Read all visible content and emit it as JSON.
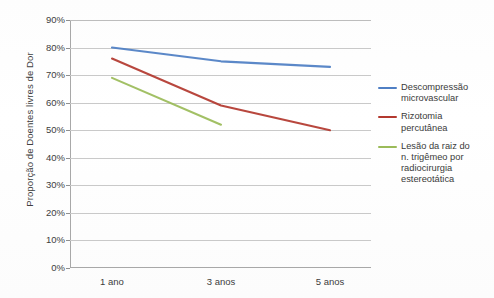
{
  "chart_data": {
    "type": "line",
    "title": "",
    "xlabel": "",
    "ylabel": "Proporção de Doentes livres de Dor",
    "categories": [
      "1 ano",
      "3 anos",
      "5 anos"
    ],
    "ytick_labels": [
      "90%",
      "80%",
      "70%",
      "60%",
      "50%",
      "40%",
      "30%",
      "20%",
      "10%",
      "0%"
    ],
    "ytick_values": [
      90,
      80,
      70,
      60,
      50,
      40,
      30,
      20,
      10,
      0
    ],
    "ylim": [
      0,
      90
    ],
    "grid": "horizontal",
    "legend_position": "right",
    "series": [
      {
        "name": "Descompressão microvascular",
        "color": "#4f7fc4",
        "x": [
          "1 ano",
          "3 anos",
          "5 anos"
        ],
        "values": [
          80,
          75,
          73
        ]
      },
      {
        "name": "Rizotomia percutânea",
        "color": "#b3392f",
        "x": [
          "1 ano",
          "3 anos",
          "5 anos"
        ],
        "values": [
          76,
          59,
          50
        ]
      },
      {
        "name": "Lesão da raiz do n. trigêmeo por radiocirurgia estereotática",
        "color": "#9bbb59",
        "x": [
          "1 ano",
          "3 anos"
        ],
        "values": [
          69,
          52
        ]
      }
    ]
  },
  "legend": {
    "entries": [
      {
        "label": "Descompressão\nmicrovascular",
        "color": "#4f7fc4"
      },
      {
        "label": "Rizotomia\npercutânea",
        "color": "#b3392f"
      },
      {
        "label": "Lesão da raiz do\nn. trigêmeo por\nradiocirurgia\nestereotática",
        "color": "#9bbb59"
      }
    ]
  },
  "axes": {
    "y_title": "Proporção de Doentes livres de Dor",
    "y_ticks": [
      "90%",
      "80%",
      "70%",
      "60%",
      "50%",
      "40%",
      "30%",
      "20%",
      "10%",
      "0%"
    ],
    "x_ticks": [
      "1 ano",
      "3 anos",
      "5 anos"
    ]
  },
  "title_clipped": ""
}
